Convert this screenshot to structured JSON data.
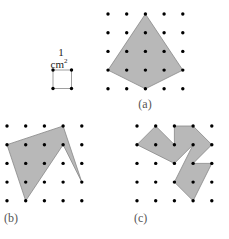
{
  "diagram": {
    "unit_square": {
      "label_number": "1",
      "label_unit": "cm",
      "label_exponent": "2",
      "corners": [
        [
          0,
          0
        ],
        [
          1,
          0
        ],
        [
          1,
          1
        ],
        [
          0,
          1
        ]
      ]
    },
    "grid": {
      "rows": 5,
      "cols": 5
    },
    "figures": [
      {
        "id": "a",
        "label": "(a)",
        "polygon": [
          [
            2,
            0
          ],
          [
            0,
            3
          ],
          [
            2,
            4
          ],
          [
            4,
            3
          ]
        ]
      },
      {
        "id": "b",
        "label": "(b)",
        "polygon": [
          [
            0,
            1
          ],
          [
            1,
            4
          ],
          [
            3,
            1
          ],
          [
            4,
            3
          ],
          [
            3,
            0
          ]
        ]
      },
      {
        "id": "c",
        "label": "(c)",
        "polygon": [
          [
            1,
            0
          ],
          [
            0,
            1
          ],
          [
            2,
            2
          ],
          [
            3,
            1
          ],
          [
            2,
            3
          ],
          [
            3,
            4
          ],
          [
            4,
            2
          ],
          [
            3,
            2
          ],
          [
            4,
            1
          ],
          [
            3,
            0
          ],
          [
            2,
            0
          ],
          [
            2,
            1
          ]
        ]
      }
    ],
    "colors": {
      "fill": "#b8b8b8",
      "stroke": "#888888",
      "dot": "#000000",
      "label": "#555555"
    }
  }
}
